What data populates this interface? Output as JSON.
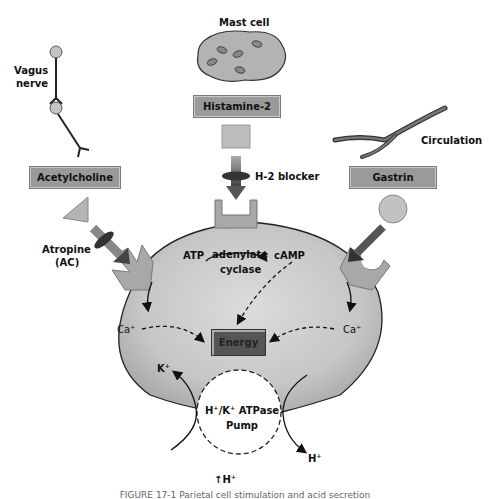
{
  "figure": {
    "sources": {
      "mast_cell": "Mast cell",
      "vagus_nerve_line1": "Vagus",
      "vagus_nerve_line2": "nerve",
      "circulation": "Circulation"
    },
    "mediators": {
      "acetylcholine": "Acetylcholine",
      "histamine": "Histamine-2",
      "gastrin": "Gastrin"
    },
    "blockers": {
      "atropine_line1": "Atropine",
      "atropine_line2": "(AC)",
      "h2_blocker": "H-2 blocker"
    },
    "cell": {
      "atp": "ATP",
      "enzyme_line1": "adenylate",
      "enzyme_line2": "cyclase",
      "camp": "cAMP",
      "calcium_left": "Ca⁺",
      "calcium_right": "Ca⁺",
      "energy": "Energy",
      "potassium": "K⁺",
      "pump_line1": "H⁺/K⁺ ATPase",
      "pump_line2": "Pump",
      "hydrogen_out": "H⁺",
      "increased_h": "↑H⁺"
    },
    "colors": {
      "cell_fill": "#c4c4c4",
      "cell_edge": "#222222",
      "receptor": "#a8a8a8",
      "label_box": "#9a9a9a",
      "energy_box": "#555555",
      "arrow": "#444444"
    },
    "caption": "FIGURE 17-1 Parietal cell stimulation and acid secretion"
  }
}
